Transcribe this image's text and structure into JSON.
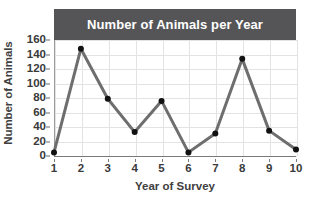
{
  "chart_data": {
    "type": "line",
    "title": "Number of Animals per Year",
    "xlabel": "Year of Survey",
    "ylabel": "Number of Animals",
    "x": [
      1,
      2,
      3,
      4,
      5,
      6,
      7,
      8,
      9,
      10
    ],
    "values": [
      5,
      148,
      79,
      33,
      76,
      5,
      31,
      134,
      35,
      9
    ],
    "xlim": [
      1,
      10
    ],
    "ylim": [
      0,
      160
    ],
    "ytick_labels": [
      "0",
      "20",
      "40",
      "60",
      "80",
      "100",
      "120",
      "140",
      "160"
    ],
    "ytick_values": [
      0,
      20,
      40,
      60,
      80,
      100,
      120,
      140,
      160
    ],
    "xtick_labels": [
      "1",
      "2",
      "3",
      "4",
      "5",
      "6",
      "7",
      "8",
      "9",
      "10"
    ],
    "grid": true,
    "legend": null,
    "markers": "filled-circle",
    "series_color": "#6e6e6e",
    "marker_color": "#111111",
    "gridline_color": "#e3e3e6",
    "title_banner_color": "#555558",
    "title_text_color": "#ffffff",
    "axis_text_color": "#3a3a3a"
  }
}
